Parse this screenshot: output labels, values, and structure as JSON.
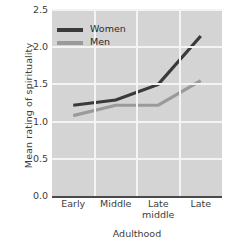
{
  "chart_data": {
    "type": "line",
    "title": "",
    "xlabel": "Adulthood",
    "ylabel": "Mean rating of spirituality",
    "categories": [
      "Early",
      "Middle",
      "Late middle",
      "Late"
    ],
    "category_lines": [
      [
        "Early"
      ],
      [
        "Middle"
      ],
      [
        "Late",
        "middle"
      ],
      [
        "Late"
      ]
    ],
    "series": [
      {
        "name": "Women",
        "values": [
          1.22,
          1.29,
          1.5,
          2.15
        ],
        "color": "#3a3a3a"
      },
      {
        "name": "Men",
        "values": [
          1.08,
          1.22,
          1.22,
          1.55
        ],
        "color": "#9a9a9a"
      }
    ],
    "ylim": [
      0.0,
      2.5
    ],
    "yticks": [
      "0.0",
      "0.5",
      "1.0",
      "1.5",
      "2.0",
      "2.5"
    ],
    "ytick_values": [
      0.0,
      0.5,
      1.0,
      1.5,
      2.0,
      2.5
    ],
    "grid": true,
    "grid_color": "#f4f4f4",
    "plot_background": "#d4d4d4",
    "legend_position": "upper left"
  },
  "legend": {
    "entries": [
      {
        "label": "Women"
      },
      {
        "label": "Men"
      }
    ]
  }
}
